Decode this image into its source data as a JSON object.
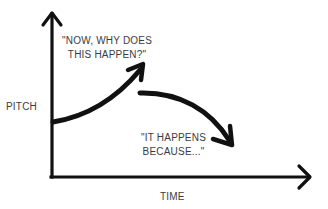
{
  "diagram": {
    "axes": {
      "y_label": "PITCH",
      "x_label": "TIME"
    },
    "annotations": {
      "rise_quote_line1": "\"NOW, WHY DOES",
      "rise_quote_line2": "THIS HAPPEN?\"",
      "fall_quote_line1": "\"IT HAPPENS",
      "fall_quote_line2": "BECAUSE...\""
    },
    "colors": {
      "stroke": "#111111",
      "text": "#3c3c3c",
      "background": "#ffffff"
    }
  }
}
